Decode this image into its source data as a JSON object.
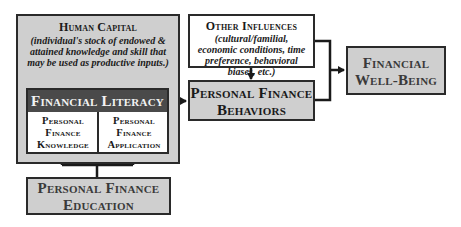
{
  "diagram": {
    "human_capital": {
      "title": "Human Capital",
      "description": "(individual's stock of endowed & attained knowledge and skill that may be used as productive inputs.)"
    },
    "financial_literacy": {
      "title": "Financial Literacy",
      "components": [
        {
          "line1": "Personal",
          "line2": "Finance",
          "line3": "Knowledge"
        },
        {
          "line1": "Personal",
          "line2": "Finance",
          "line3": "Application"
        }
      ]
    },
    "education": {
      "line1": "Personal Finance",
      "line2": "Education"
    },
    "other_influences": {
      "title": "Other Influences",
      "description": "(cultural/familial, economic conditions, time preference, behavioral biases, etc.)"
    },
    "behaviors": {
      "line1": "Personal Finance",
      "line2": "Behaviors"
    },
    "well_being": {
      "line1": "Financial",
      "line2": "Well-Being"
    },
    "colors": {
      "box_gray": "#cfcfcf",
      "box_dark": "#4a4a4a",
      "stroke": "#1a1a1a"
    }
  }
}
